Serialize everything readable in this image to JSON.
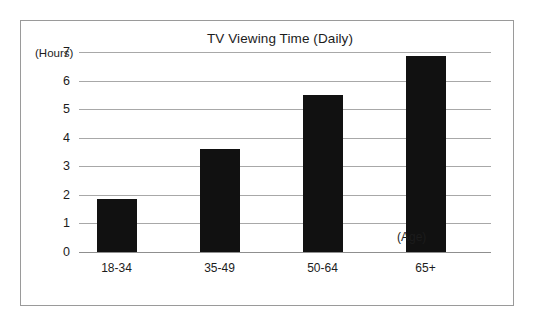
{
  "chart_data": {
    "type": "bar",
    "title": "TV Viewing Time (Daily)",
    "xlabel": "(Age)",
    "ylabel": "(Hours)",
    "categories": [
      "18-34",
      "35-49",
      "50-64",
      "65+"
    ],
    "values": [
      1.85,
      3.6,
      5.5,
      6.85
    ],
    "ylim": [
      0,
      7
    ],
    "yticks": [
      0,
      1,
      2,
      3,
      4,
      5,
      6,
      7
    ],
    "ytick_labels": [
      "0",
      "1",
      "2",
      "3",
      "4",
      "5",
      "6",
      "7"
    ],
    "grid": true,
    "legend": false,
    "bar_color": "#111111",
    "gridline_color": "#a8a8a8",
    "frame_color": "#9a9a9a",
    "background_color": "#ffffff"
  }
}
